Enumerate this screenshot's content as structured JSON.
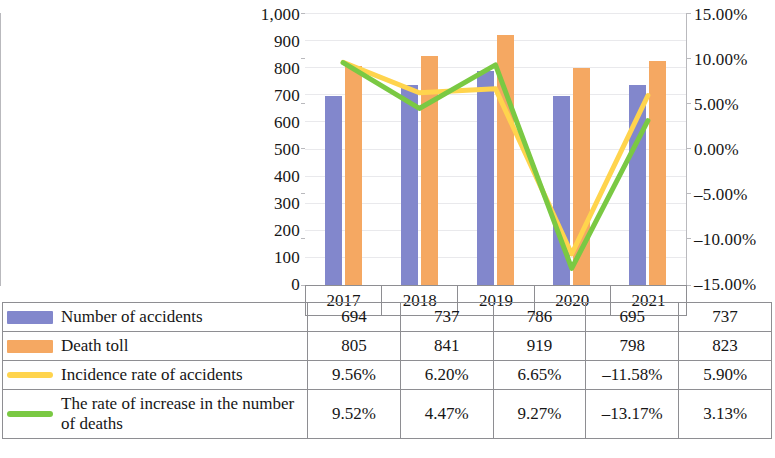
{
  "chart_data": {
    "type": "bar",
    "title": "",
    "xlabel": "",
    "ylabel": "",
    "categories": [
      "2017",
      "2018",
      "2019",
      "2020",
      "2021"
    ],
    "grid": true,
    "legend_position": "bottom-table",
    "ylim": [
      0,
      1000
    ],
    "y_ticks": [
      "0",
      "100",
      "200",
      "300",
      "400",
      "500",
      "600",
      "700",
      "800",
      "900",
      "1,000"
    ],
    "y2lim": [
      -15,
      15
    ],
    "y2_ticks": [
      "–15.00%",
      "–10.00%",
      "–5.00%",
      "0.00%",
      "5.00%",
      "10.00%",
      "15.00%"
    ],
    "series": [
      {
        "name": "Number of accidents",
        "type": "bar",
        "axis": "left",
        "color": "#8287cc",
        "values": [
          694,
          737,
          786,
          695,
          737
        ],
        "labels": [
          "694",
          "737",
          "786",
          "695",
          "737"
        ]
      },
      {
        "name": "Death toll",
        "type": "bar",
        "axis": "left",
        "color": "#f5a862",
        "values": [
          805,
          841,
          919,
          798,
          823
        ],
        "labels": [
          "805",
          "841",
          "919",
          "798",
          "823"
        ]
      },
      {
        "name": "Incidence rate of accidents",
        "type": "line",
        "axis": "right",
        "color": "#ffd44d",
        "values": [
          9.56,
          6.2,
          6.65,
          -11.58,
          5.9
        ],
        "labels": [
          "9.56%",
          "6.20%",
          "6.65%",
          "–11.58%",
          "5.90%"
        ]
      },
      {
        "name": "The rate of increase in the number of deaths",
        "type": "line",
        "axis": "right",
        "color": "#7ac943",
        "values": [
          9.52,
          4.47,
          9.27,
          -13.17,
          3.13
        ],
        "labels": [
          "9.52%",
          "4.47%",
          "9.27%",
          "–13.17%",
          "3.13%"
        ]
      }
    ]
  },
  "axis": {
    "left_ticks": [
      "1,000",
      "900",
      "800",
      "700",
      "600",
      "500",
      "400",
      "300",
      "200",
      "100",
      "0"
    ],
    "right_ticks": [
      "15.00%",
      "10.00%",
      "5.00%",
      "0.00%",
      "–5.00%",
      "–10.00%",
      "–15.00%"
    ]
  },
  "table": {
    "years": [
      "2017",
      "2018",
      "2019",
      "2020",
      "2021"
    ],
    "rows": [
      {
        "swatch": "box-blue",
        "label": "Number of accidents",
        "values": [
          "694",
          "737",
          "786",
          "695",
          "737"
        ]
      },
      {
        "swatch": "box-orange",
        "label": "Death toll",
        "values": [
          "805",
          "841",
          "919",
          "798",
          "823"
        ]
      },
      {
        "swatch": "line-yellow",
        "label": "Incidence rate of accidents",
        "values": [
          "9.56%",
          "6.20%",
          "6.65%",
          "–11.58%",
          "5.90%"
        ]
      },
      {
        "swatch": "line-green",
        "label": "The rate of increase in the number of deaths",
        "values": [
          "9.52%",
          "4.47%",
          "9.27%",
          "–13.17%",
          "3.13%"
        ]
      }
    ]
  }
}
